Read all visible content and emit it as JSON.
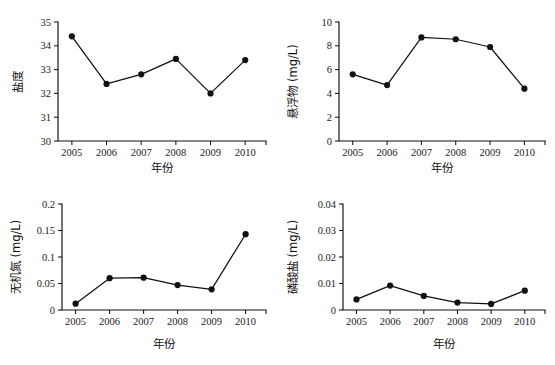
{
  "figure": {
    "title": "",
    "background_color": "#ffffff",
    "line_color": "#111111",
    "marker_color": "#111111",
    "panel_count": 4
  },
  "chart_data": [
    {
      "type": "line",
      "panel": "top-left",
      "title": "",
      "xlabel": "年份",
      "ylabel": "盐度",
      "x": [
        2005,
        2006,
        2007,
        2008,
        2009,
        2010
      ],
      "categories": [
        "2005",
        "2006",
        "2007",
        "2008",
        "2009",
        "2010"
      ],
      "values": [
        34.4,
        32.4,
        32.8,
        33.45,
        32.0,
        33.4
      ],
      "ylim": [
        30,
        35
      ],
      "yticks": [
        30,
        31,
        32,
        33,
        34,
        35
      ],
      "ytick_labels": [
        "30",
        "31",
        "32",
        "33",
        "34",
        "35"
      ],
      "xlim": [
        2004.6,
        2010.6
      ],
      "xticks": [
        2005,
        2006,
        2007,
        2008,
        2009,
        2010
      ],
      "grid": false,
      "legend": null,
      "marker": "filled-circle"
    },
    {
      "type": "line",
      "panel": "top-right",
      "title": "",
      "xlabel": "年份",
      "ylabel": "悬浮物 (mg/L)",
      "x": [
        2005,
        2006,
        2007,
        2008,
        2009,
        2010
      ],
      "categories": [
        "2005",
        "2006",
        "2007",
        "2008",
        "2009",
        "2010"
      ],
      "values": [
        5.6,
        4.7,
        8.7,
        8.55,
        7.9,
        4.4
      ],
      "ylim": [
        0,
        10
      ],
      "yticks": [
        0,
        2,
        4,
        6,
        8,
        10
      ],
      "ytick_labels": [
        "0",
        "2",
        "4",
        "6",
        "8",
        "10"
      ],
      "xlim": [
        2004.6,
        2010.6
      ],
      "xticks": [
        2005,
        2006,
        2007,
        2008,
        2009,
        2010
      ],
      "grid": false,
      "legend": null,
      "marker": "filled-circle"
    },
    {
      "type": "line",
      "panel": "bottom-left",
      "title": "",
      "xlabel": "年份",
      "ylabel": "无机氮 (mg/L)",
      "x": [
        2005,
        2006,
        2007,
        2008,
        2009,
        2010
      ],
      "categories": [
        "2005",
        "2006",
        "2007",
        "2008",
        "2009",
        "2010"
      ],
      "values": [
        0.012,
        0.06,
        0.061,
        0.047,
        0.039,
        0.143
      ],
      "ylim": [
        0,
        0.2
      ],
      "yticks": [
        0,
        0.05,
        0.1,
        0.15,
        0.2
      ],
      "ytick_labels": [
        "0",
        "0.05",
        "0.1",
        "0.15",
        "0.2"
      ],
      "xlim": [
        2004.6,
        2010.6
      ],
      "xticks": [
        2005,
        2006,
        2007,
        2008,
        2009,
        2010
      ],
      "grid": false,
      "legend": null,
      "marker": "filled-circle"
    },
    {
      "type": "line",
      "panel": "bottom-right",
      "title": "",
      "xlabel": "年份",
      "ylabel": "磷酸盐 (mg/L)",
      "x": [
        2005,
        2006,
        2007,
        2008,
        2009,
        2010
      ],
      "categories": [
        "2005",
        "2006",
        "2007",
        "2008",
        "2009",
        "2010"
      ],
      "values": [
        0.004,
        0.0092,
        0.0053,
        0.0028,
        0.0023,
        0.0073
      ],
      "ylim": [
        0,
        0.04
      ],
      "yticks": [
        0,
        0.01,
        0.02,
        0.03,
        0.04
      ],
      "ytick_labels": [
        "0",
        "0.01",
        "0.02",
        "0.03",
        "0.04"
      ],
      "xlim": [
        2004.6,
        2010.6
      ],
      "xticks": [
        2005,
        2006,
        2007,
        2008,
        2009,
        2010
      ],
      "grid": false,
      "legend": null,
      "marker": "filled-circle"
    }
  ]
}
